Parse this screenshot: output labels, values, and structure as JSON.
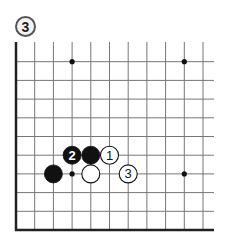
{
  "diagram_label": "3",
  "board": {
    "origin_x": 16,
    "origin_y": 230,
    "spacing": 18.7,
    "cols_visible": 11,
    "rows_visible": 10,
    "top_cut_y": 42,
    "right_cut_x": 214,
    "line_color": "#777777",
    "edge_color": "#222222"
  },
  "star_points": [
    {
      "col": 3,
      "row": 9
    },
    {
      "col": 9,
      "row": 9
    },
    {
      "col": 3,
      "row": 3
    },
    {
      "col": 9,
      "row": 3
    }
  ],
  "stones": [
    {
      "color": "black",
      "col": 3,
      "row": 4,
      "label": "2"
    },
    {
      "color": "black",
      "col": 4,
      "row": 4,
      "label": ""
    },
    {
      "color": "white",
      "col": 5,
      "row": 4,
      "label": "1"
    },
    {
      "color": "black",
      "col": 2,
      "row": 3,
      "label": ""
    },
    {
      "color": "white",
      "col": 4,
      "row": 3,
      "label": ""
    },
    {
      "color": "white",
      "col": 6,
      "row": 3,
      "label": "3"
    }
  ]
}
